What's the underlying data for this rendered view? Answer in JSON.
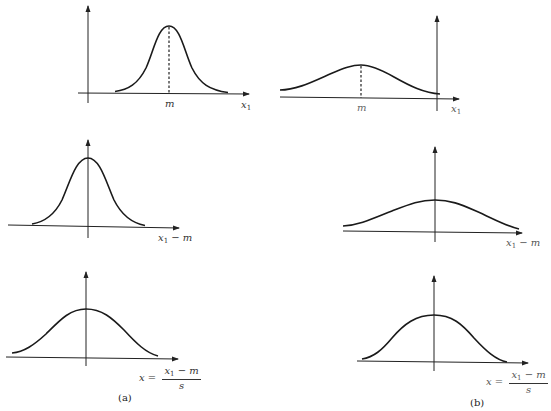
{
  "panels": {
    "a": {
      "caption": "(a)",
      "top": {
        "peak_label": "m",
        "x_label_var": "x",
        "x_label_sub": "1"
      },
      "middle": {
        "x_label_var": "x",
        "x_label_sub": "1",
        "x_label_rest": "− m"
      },
      "bottom": {
        "x_label_lhs": "x =",
        "x_label_num_var": "x",
        "x_label_num_sub": "1",
        "x_label_num_rest": "− m",
        "x_label_den": "s"
      }
    },
    "b": {
      "caption": "(b)",
      "top": {
        "peak_label": "m",
        "x_label_var": "x",
        "x_label_sub": "1"
      },
      "middle": {
        "x_label_var": "x",
        "x_label_sub": "1",
        "x_label_rest": "− m"
      },
      "bottom": {
        "x_label_lhs": "x =",
        "x_label_num_var": "x",
        "x_label_num_sub": "1",
        "x_label_num_rest": "− m",
        "x_label_den": "s"
      }
    }
  },
  "description": {
    "a": [
      "Narrow normal curve centered at mean m (positive), x-axis x1",
      "Shifted curve centered at origin, x-axis x1 − m",
      "Standardized curve (wider), x-axis x = (x1 − m)/s"
    ],
    "b": [
      "Wide normal curve centered at mean m (negative), x-axis x1",
      "Shifted curve centered at origin, x-axis x1 − m",
      "Standardized curve (narrower), x-axis x = (x1 − m)/s"
    ]
  }
}
